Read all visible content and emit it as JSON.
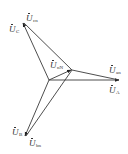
{
  "diagram": {
    "line_color": "#3a3a3a",
    "points": {
      "N": {
        "x": 49,
        "y": 80
      },
      "n": {
        "x": 72,
        "y": 70
      },
      "A": {
        "x": 120,
        "y": 80
      },
      "B": {
        "x": 25,
        "y": 137
      },
      "C": {
        "x": 23,
        "y": 22
      }
    },
    "phasors": [
      {
        "from": "N",
        "to": "A",
        "label": "U_A"
      },
      {
        "from": "N",
        "to": "B",
        "label": "U_B"
      },
      {
        "from": "N",
        "to": "C",
        "label": "U_C"
      },
      {
        "from": "n",
        "to": "A",
        "label": "U_an"
      },
      {
        "from": "n",
        "to": "B",
        "label": "U_bn"
      },
      {
        "from": "n",
        "to": "C",
        "label": "U_cn"
      },
      {
        "from": "N",
        "to": "n",
        "label": "U_nN"
      }
    ],
    "labels": {
      "ucn": {
        "main": "U",
        "sub": "cn"
      },
      "uc": {
        "main": "U",
        "sub": "C"
      },
      "unN": {
        "main": "U",
        "sub": "nN"
      },
      "uan": {
        "main": "U",
        "sub": "an"
      },
      "ua": {
        "main": "U",
        "sub": "A"
      },
      "ub": {
        "main": "U",
        "sub": "B"
      },
      "ubn": {
        "main": "U",
        "sub": "bn"
      }
    }
  }
}
